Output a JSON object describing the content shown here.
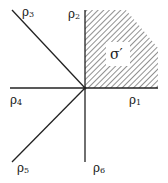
{
  "diagram": {
    "type": "fan",
    "rays": [
      {
        "id": "rho1",
        "base": "ρ",
        "index": "1",
        "direction": "east"
      },
      {
        "id": "rho2",
        "base": "ρ",
        "index": "2",
        "direction": "north"
      },
      {
        "id": "rho3",
        "base": "ρ",
        "index": "3",
        "direction": "northwest"
      },
      {
        "id": "rho4",
        "base": "ρ",
        "index": "4",
        "direction": "west"
      },
      {
        "id": "rho5",
        "base": "ρ",
        "index": "5",
        "direction": "southwest"
      },
      {
        "id": "rho6",
        "base": "ρ",
        "index": "6",
        "direction": "south"
      }
    ],
    "cone": {
      "label": "σ′",
      "between": [
        "rho1",
        "rho2"
      ],
      "fill": "hatched"
    },
    "colors": {
      "line": "#222222",
      "hatch": "#555555",
      "background": "#ffffff"
    }
  }
}
